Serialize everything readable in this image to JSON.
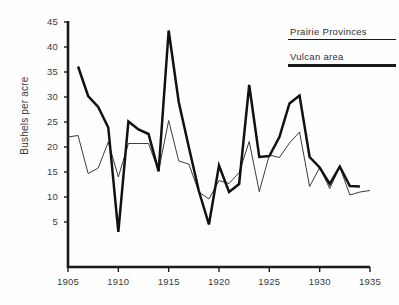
{
  "chart_data": {
    "type": "line",
    "title": "",
    "xlabel": "",
    "ylabel": "Bushels per acre",
    "xlim": [
      1905,
      1935
    ],
    "ylim": [
      0,
      45
    ],
    "grid": false,
    "legend_position": "top-right",
    "y_ticks": [
      45,
      40,
      35,
      30,
      25,
      20,
      15,
      10,
      5
    ],
    "x_ticks": [
      1905,
      1910,
      1915,
      1920,
      1925,
      1930,
      1935
    ],
    "series": [
      {
        "name": "Prairie Provinces",
        "style": "thin",
        "color": "#262626",
        "x": [
          1905,
          1906,
          1907,
          1908,
          1909,
          1910,
          1911,
          1912,
          1913,
          1914,
          1915,
          1916,
          1917,
          1918,
          1919,
          1920,
          1921,
          1922,
          1923,
          1924,
          1925,
          1926,
          1927,
          1928,
          1929,
          1930,
          1931,
          1932,
          1933,
          1934,
          1935
        ],
        "y": [
          22.0,
          22.3,
          14.7,
          15.8,
          21.0,
          14.0,
          20.7,
          20.7,
          20.7,
          15.2,
          25.3,
          17.2,
          16.6,
          11.0,
          9.6,
          13.3,
          12.7,
          14.9,
          21.1,
          11.1,
          18.4,
          17.9,
          20.8,
          23.0,
          12.1,
          15.9,
          11.7,
          16.0,
          10.4,
          11.0,
          11.3
        ]
      },
      {
        "name": "Vulcan area",
        "style": "thick",
        "color": "#111111",
        "x": [
          1906,
          1907,
          1908,
          1909,
          1910,
          1911,
          1912,
          1913,
          1914,
          1915,
          1916,
          1917,
          1918,
          1919,
          1920,
          1921,
          1922,
          1923,
          1924,
          1925,
          1926,
          1927,
          1928,
          1929,
          1930,
          1931,
          1932,
          1933,
          1934
        ],
        "y": [
          36.1,
          30.2,
          28.0,
          23.9,
          3.0,
          25.1,
          23.5,
          22.6,
          15.1,
          43.3,
          29.0,
          20.0,
          11.2,
          4.5,
          16.3,
          11.0,
          12.6,
          32.4,
          18.0,
          18.2,
          22.0,
          28.7,
          30.3,
          18.0,
          15.9,
          12.6,
          16.1,
          12.2,
          12.1
        ]
      }
    ]
  },
  "axis": {
    "y_title": "Bushels per acre",
    "y_tick_labels": [
      "45",
      "40",
      "35",
      "30",
      "25",
      "20",
      "15",
      "10",
      "5"
    ],
    "x_tick_labels": [
      "1905",
      "1910",
      "1915",
      "1920",
      "1925",
      "1930",
      "1935"
    ]
  },
  "legend": {
    "entries": [
      {
        "label": "Prairie  Provinces",
        "rule": "thin"
      },
      {
        "label": "Vulcan area",
        "rule": "thick"
      }
    ]
  },
  "colors": {
    "axis": "#1a1a1a",
    "thin_series": "#262626",
    "thick_series": "#111111",
    "background": "#fefefe",
    "text": "#3a3a3a"
  }
}
